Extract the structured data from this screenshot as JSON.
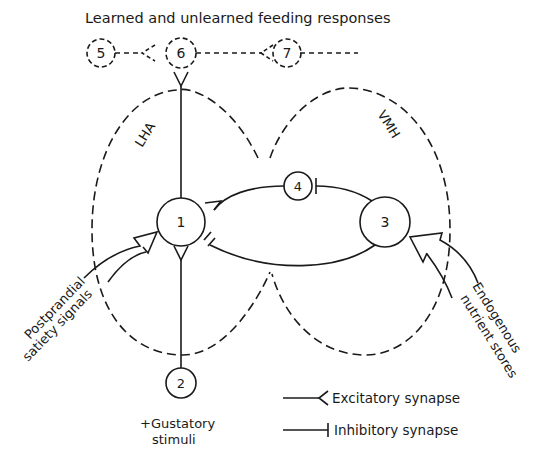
{
  "title": "Learned and unlearned feeding responses",
  "regions": {
    "lha": "LHA",
    "vmh": "VMH"
  },
  "nodes": {
    "n1": "1",
    "n2": "2",
    "n3": "3",
    "n4": "4",
    "n5": "5",
    "n6": "6",
    "n7": "7"
  },
  "inputs": {
    "left_line1": "Postprandial",
    "left_line2": "satiety signals",
    "right_line1": "Endogenous",
    "right_line2": "nutrient stores",
    "gustatory_line1": "+Gustatory",
    "gustatory_line2": "stimuli"
  },
  "legend": {
    "excitatory": "Excitatory synapse",
    "inhibitory": "Inhibitory synapse"
  },
  "colors": {
    "ink": "#1a1a1a",
    "background": "#ffffff"
  }
}
